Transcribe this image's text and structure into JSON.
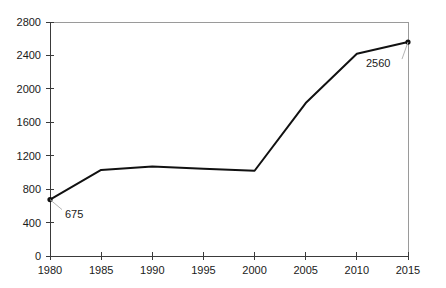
{
  "chart_data": {
    "type": "line",
    "title": "",
    "subtitle": "",
    "xlabel": "",
    "ylabel": "",
    "x": [
      1980,
      1985,
      1990,
      1995,
      2000,
      2005,
      2010,
      2015
    ],
    "categories": [
      "1980",
      "1985",
      "1990",
      "1995",
      "2000",
      "2005",
      "2010",
      "2015"
    ],
    "values": [
      675,
      1030,
      1070,
      1045,
      1020,
      1830,
      2420,
      2560
    ],
    "series": [
      {
        "name": "",
        "values": [
          675,
          1030,
          1070,
          1045,
          1020,
          1830,
          2420,
          2560
        ]
      }
    ],
    "xlim": [
      1980,
      2015
    ],
    "ylim": [
      0,
      2800
    ],
    "ytick_values": [
      0,
      400,
      800,
      1200,
      1600,
      2000,
      2400,
      2800
    ],
    "ytick_labels": [
      "0",
      "400",
      "800",
      "1200",
      "1600",
      "2000",
      "2400",
      "2800"
    ],
    "xtick_values": [
      1980,
      1985,
      1990,
      1995,
      2000,
      2005,
      2010,
      2015
    ],
    "xtick_labels": [
      "1980",
      "1985",
      "1990",
      "1995",
      "2000",
      "2005",
      "2010",
      "2015"
    ],
    "grid": false,
    "legend": false,
    "legend_position": "none",
    "data_labels": [
      {
        "x": 1980,
        "y": 675,
        "text": "675"
      },
      {
        "x": 2015,
        "y": 2560,
        "text": "2560"
      }
    ],
    "markers": [
      {
        "x": 1980,
        "y": 675
      },
      {
        "x": 2015,
        "y": 2560
      }
    ],
    "colors": {
      "line": "#111111",
      "axis": "#3a3a3a",
      "frame": "#9a9a9a",
      "text": "#1a1a1a",
      "background": "#ffffff",
      "leader": "#b5b5b5"
    }
  }
}
